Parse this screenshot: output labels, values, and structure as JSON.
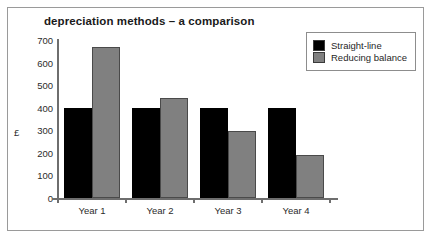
{
  "chart_data": {
    "type": "bar",
    "title": "depreciation methods – a comparison",
    "xlabel": "",
    "ylabel": "£",
    "categories": [
      "Year 1",
      "Year 2",
      "Year 3",
      "Year 4"
    ],
    "series": [
      {
        "name": "Straight-line",
        "color": "#000000",
        "values": [
          400,
          400,
          400,
          400
        ]
      },
      {
        "name": "Reducing balance",
        "color": "#808080",
        "values": [
          670,
          445,
          295,
          190
        ]
      }
    ],
    "ylim": [
      0,
      700
    ],
    "ytick_step": 100,
    "yticks": [
      700,
      600,
      500,
      400,
      300,
      200,
      100,
      0
    ],
    "ytick_labels": [
      "700",
      "600",
      "500",
      "400",
      "300",
      "200",
      "100",
      "0"
    ],
    "grid": false,
    "legend_position": "top-right"
  },
  "legend": {
    "entries": [
      {
        "label": "Straight-line",
        "swatch": "black-swatch-icon"
      },
      {
        "label": "Reducing balance",
        "swatch": "gray-swatch-icon"
      }
    ]
  }
}
